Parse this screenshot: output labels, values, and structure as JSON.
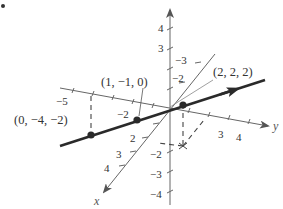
{
  "figure": {
    "type": "3d-line-plot",
    "bullet_marker": "•",
    "colors": {
      "axis": "#666666",
      "line": "#2a2a2a",
      "text": "#333333",
      "dashed": "#444444"
    }
  },
  "axes": {
    "x": {
      "label": "x",
      "ticks": [
        {
          "value": 2,
          "label": "2"
        },
        {
          "value": 3,
          "label": "3"
        },
        {
          "value": 4,
          "label": "4"
        }
      ]
    },
    "y": {
      "label": "y",
      "ticks": [
        {
          "value": -5,
          "label": "−5"
        },
        {
          "value": -2,
          "label": "−2"
        },
        {
          "value": 3,
          "label": "3"
        },
        {
          "value": 4,
          "label": "4"
        }
      ]
    },
    "z": {
      "label": "z",
      "ticks": [
        {
          "value": 4,
          "label": "4"
        },
        {
          "value": 3,
          "label": "3"
        },
        {
          "value": -2,
          "label": "−2"
        },
        {
          "value": -3,
          "label": "−3"
        },
        {
          "value": -4,
          "label": "−4"
        }
      ]
    },
    "x_negative_ticks": [
      {
        "value": -3,
        "label": "−3"
      },
      {
        "value": -2,
        "label": "−2"
      }
    ]
  },
  "points": [
    {
      "coords": [
        0,
        -4,
        -2
      ],
      "label": "(0, −4, −2)"
    },
    {
      "coords": [
        1,
        -1,
        0
      ],
      "label": "(1, −1, 0)"
    },
    {
      "coords": [
        2,
        2,
        2
      ],
      "label": "(2, 2, 2)"
    }
  ],
  "line": {
    "direction": [
      1,
      3,
      2
    ],
    "passes_through": "(1, −1, 0)"
  }
}
